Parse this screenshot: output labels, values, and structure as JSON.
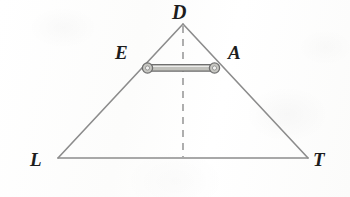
{
  "figure": {
    "background_color": "#fdfdfd",
    "stroke_color": "#8c8c8c",
    "dashed_stroke_color": "#9a9a9a",
    "bar_fill_color": "#b9b9b4",
    "bar_outline_color": "#6f6f6f",
    "label_color": "#1d1d1d",
    "labels": {
      "apex": "D",
      "left_on_side": "E",
      "right_on_side": "A",
      "bottom_left": "L",
      "bottom_right": "T"
    },
    "points": {
      "D": {
        "x": 183,
        "y": 24
      },
      "L": {
        "x": 58,
        "y": 158
      },
      "T": {
        "x": 308,
        "y": 158
      },
      "E": {
        "x": 147,
        "y": 68
      },
      "A": {
        "x": 215,
        "y": 68
      },
      "foot": {
        "x": 183,
        "y": 158
      }
    },
    "elements": {
      "triangle_name": "triangle-ldt",
      "altitude_name": "dashed-altitude-d-to-base",
      "bar_name": "segment-bar-ea"
    }
  }
}
